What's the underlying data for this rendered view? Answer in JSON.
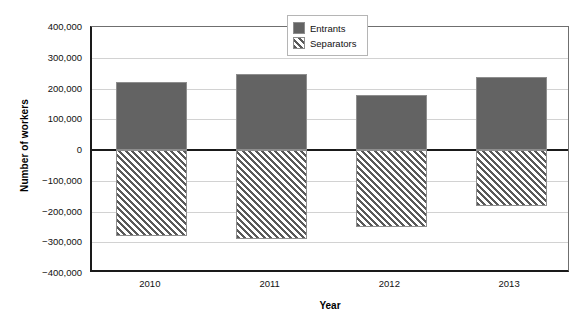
{
  "chart_data": {
    "type": "bar",
    "title": "",
    "subtitle": "",
    "xlabel": "Year",
    "ylabel": "Number of workers",
    "categories": [
      "2010",
      "2011",
      "2012",
      "2013"
    ],
    "series": [
      {
        "name": "Entrants",
        "values": [
          222000,
          248000,
          179000,
          238000
        ]
      },
      {
        "name": "Separators",
        "values": [
          -280000,
          -290000,
          -251000,
          -182000
        ]
      }
    ],
    "ylim": [
      -400000,
      400000
    ],
    "ytick_labels": [
      "400,000",
      "300,000",
      "200,000",
      "100,000",
      "0",
      "−100,000",
      "−200,000",
      "−300,000",
      "−400,000"
    ],
    "ytick_values": [
      400000,
      300000,
      200000,
      100000,
      0,
      -100000,
      -200000,
      -300000,
      -400000
    ],
    "grid": true,
    "legend_position": "top-center",
    "colors": {
      "entrants_fill": "#636363",
      "separators_hatch": "#595959",
      "separators_background": "#ffffff",
      "gridline": "#d2d2d2",
      "axis": "#1a1a1a",
      "bar_outline": "#8e8e8e"
    }
  },
  "legend": {
    "items": [
      {
        "label": "Entrants",
        "swatch": "solid-gray-swatch"
      },
      {
        "label": "Separators",
        "swatch": "hatched-swatch"
      }
    ]
  }
}
